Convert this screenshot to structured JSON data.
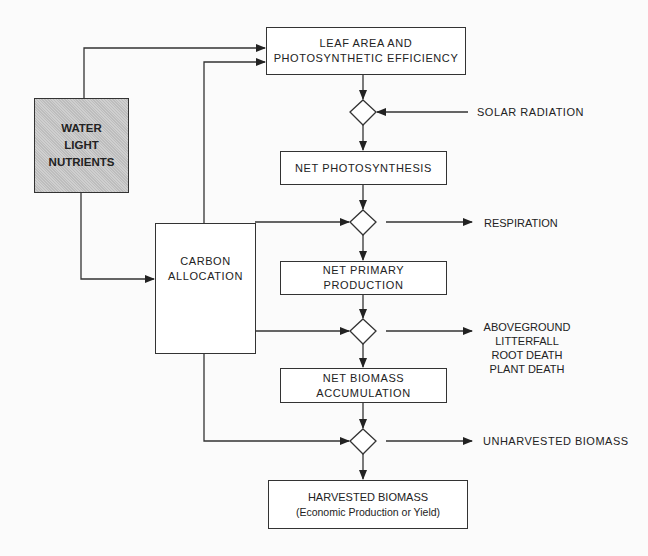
{
  "diagram": {
    "inputs_box": {
      "lines": [
        "WATER",
        "LIGHT",
        "NUTRIENTS"
      ]
    },
    "carbon_allocation": {
      "lines": [
        "CARBON",
        "ALLOCATION"
      ]
    },
    "leaf_area": {
      "lines": [
        "LEAF AREA AND",
        "PHOTOSYNTHETIC EFFICIENCY"
      ]
    },
    "net_photosynthesis": {
      "lines": [
        "NET PHOTOSYNTHESIS"
      ]
    },
    "net_primary_production": {
      "lines": [
        "NET PRIMARY",
        "PRODUCTION"
      ]
    },
    "net_biomass_accumulation": {
      "lines": [
        "NET BIOMASS",
        "ACCUMULATION"
      ]
    },
    "harvested_biomass": {
      "lines": [
        "HARVESTED BIOMASS",
        "(Economic Production or Yield)"
      ]
    },
    "side_labels": {
      "solar_radiation": "SOLAR RADIATION",
      "respiration": "RESPIRATION",
      "losses": [
        "ABOVEGROUND",
        "LITTERFALL",
        "ROOT DEATH",
        "PLANT DEATH"
      ],
      "unharvested": "UNHARVESTED BIOMASS"
    }
  },
  "colors": {
    "line": "#333333",
    "gray_fill": "#c8c8c8",
    "background": "#fbfbfb"
  }
}
